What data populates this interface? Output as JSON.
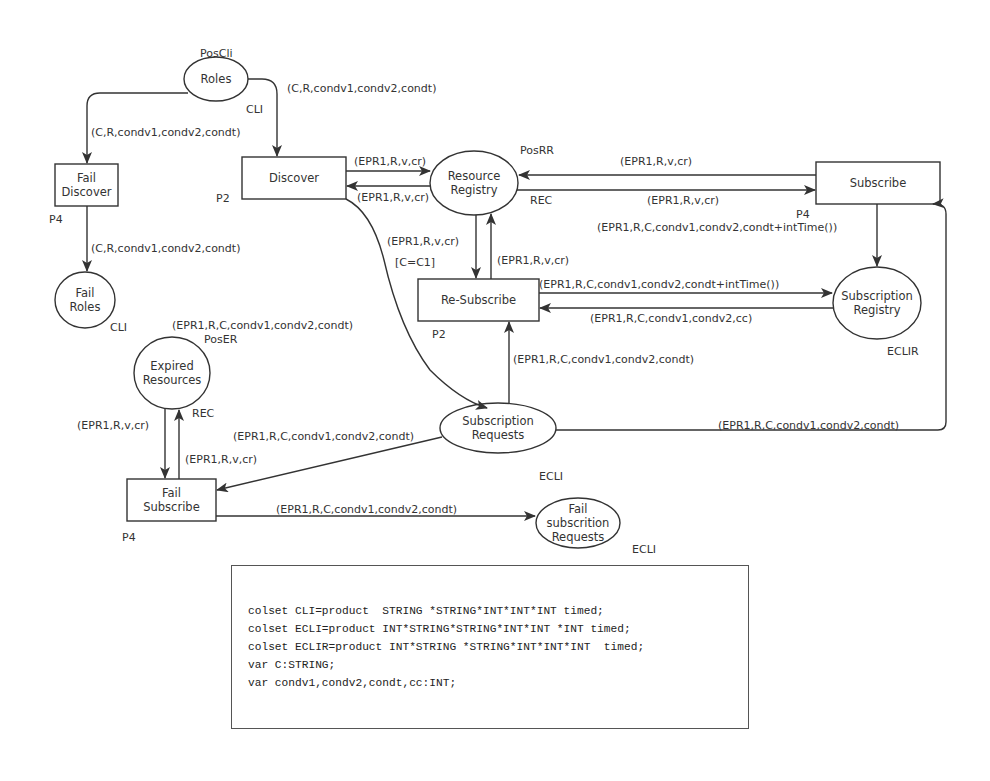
{
  "places": {
    "roles": {
      "name": "Roles",
      "position": "PosCli",
      "colorset": "CLI"
    },
    "fail_roles": {
      "name": "Fail Roles",
      "line1": "Fail",
      "line2": "Roles",
      "colorset": "CLI"
    },
    "resource_registry": {
      "name": "Resource Registry",
      "line1": "Resource",
      "line2": "Registry",
      "position": "PosRR",
      "colorset": "REC"
    },
    "subscription_registry": {
      "name": "Subscription Registry",
      "line1": "Subscription",
      "line2": "Registry",
      "colorset": "ECLIR"
    },
    "expired_resources": {
      "name": "Expired Resources",
      "line1": "Expired",
      "line2": "Resources",
      "position": "PosER",
      "colorset": "REC"
    },
    "subscription_requests": {
      "name": "Subscription Requests",
      "line1": "Subscription",
      "line2": "Requests",
      "colorset": "ECLI"
    },
    "fail_subscription_requests": {
      "name": "Fail subscrition Requests",
      "line1": "Fail",
      "line2": "subscrition",
      "line3": "Requests",
      "colorset": "ECLI"
    }
  },
  "transitions": {
    "fail_discover": {
      "name": "Fail Discover",
      "line1": "Fail",
      "line2": "Discover",
      "priority": "P4"
    },
    "discover": {
      "name": "Discover",
      "priority": "P2"
    },
    "subscribe": {
      "name": "Subscribe",
      "priority": "P4"
    },
    "re_subscribe": {
      "name": "Re-Subscribe",
      "priority": "P2",
      "guard": "[C=C1]"
    },
    "fail_subscribe": {
      "name": "Fail Subscribe",
      "line1": "Fail",
      "line2": "Subscribe",
      "priority": "P4"
    }
  },
  "arcs": {
    "roles_to_discover": "(C,R,condv1,condv2,condt)",
    "roles_to_fail_discover": "(C,R,condv1,condv2,condt)",
    "fail_discover_to_fail_roles": "(C,R,condv1,condv2,condt)",
    "discover_to_rr": "(EPR1,R,v,cr)",
    "rr_to_discover": "(EPR1,R,v,cr)",
    "subscribe_to_rr": "(EPR1,R,v,cr)",
    "rr_to_subscribe": "(EPR1,R,v,cr)",
    "subscribe_to_sreg": "(EPR1,R,C,condv1,condv2,condt+intTime())",
    "rr_to_resubscribe": "(EPR1,R,v,cr)",
    "resubscribe_to_rr": "(EPR1,R,v,cr)",
    "resubscribe_to_sreg": "(EPR1,R,C,condv1,condv2,condt+intTime())",
    "sreg_to_resubscribe": "(EPR1,R,C,condv1,condv2,cc)",
    "sreq_to_resubscribe": "(EPR1,R,C,condv1,condv2,condt)",
    "discover_to_sreq": "(EPR1,R,C,condv1,condv2,condt)",
    "sreq_to_subscribe": "(EPR1,R,C,condv1,condv2,condt)",
    "sreq_to_fail_subscribe": "(EPR1,R,C,condv1,condv2,condt)",
    "er_to_fail_subscribe": "(EPR1,R,v,cr)",
    "fail_subscribe_to_er": "(EPR1,R,v,cr)",
    "fail_subscribe_to_fsr": "(EPR1,R,C,condv1,condv2,condt)"
  },
  "declarations": [
    "colset CLI=product  STRING *STRING*INT*INT*INT timed;",
    "colset ECLI=product INT*STRING*STRING*INT*INT *INT timed;",
    "colset ECLIR=product INT*STRING *STRING*INT*INT*INT  timed;",
    "var C:STRING;",
    "var condv1,condv2,condt,cc:INT;"
  ],
  "colors": {
    "stroke": "#333333",
    "text": "#333333",
    "background": "#ffffff"
  }
}
